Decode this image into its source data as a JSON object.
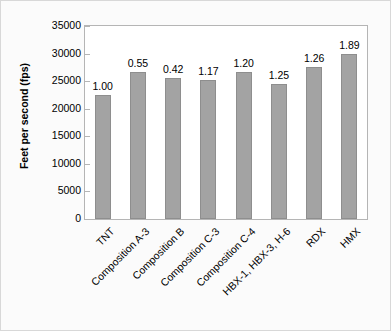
{
  "chart_data": {
    "type": "bar",
    "title": "",
    "xlabel": "",
    "ylabel": "Feet per second (fps)",
    "ylim": [
      0,
      35000
    ],
    "yticks": [
      0,
      5000,
      10000,
      15000,
      20000,
      25000,
      30000,
      35000
    ],
    "ytick_labels": [
      "0",
      "5000",
      "10000",
      "15000",
      "20000",
      "25000",
      "30000",
      "35000"
    ],
    "grid": false,
    "legend": false,
    "categories": [
      "TNT",
      "Composition A-3",
      "Composition B",
      "Composition C-3",
      "Composition C-4",
      "HBX-1, HBX-3, H-6",
      "RDX",
      "HMX"
    ],
    "values": [
      22500,
      26700,
      25600,
      25300,
      26700,
      24500,
      27500,
      29900
    ],
    "data_labels": [
      "1.00",
      "0.55",
      "0.42",
      "1.17",
      "1.20",
      "1.25",
      "1.26",
      "1.89"
    ],
    "bar_color": "#a3a3a3",
    "bar_edge_color": "#8e8e8e",
    "plot_bg_color": "#ffffff",
    "figure_bg_color": "#fbfbfb",
    "axis_color": "#b5b5b5",
    "text_color": "#000000"
  }
}
